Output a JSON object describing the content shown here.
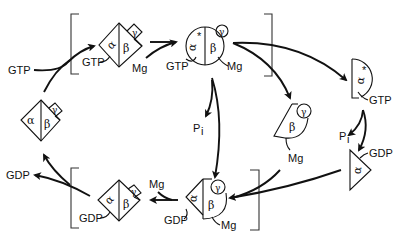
{
  "diagram": {
    "type": "G-protein activation cycle",
    "labels": {
      "gtp": "GTP",
      "gdp": "GDP",
      "mg": "Mg",
      "pi": "P",
      "pi_sub": "i",
      "alpha": "α",
      "alpha_star": "α*",
      "beta": "β",
      "gamma": "γ",
      "star": "*"
    },
    "states": [
      {
        "id": "inactive-heterotrimer",
        "subunits": [
          "α",
          "β",
          "γ"
        ],
        "shape": "diamond"
      },
      {
        "id": "gtp-bound-heterotrimer",
        "subunits": [
          "α",
          "β",
          "γ"
        ],
        "ligands": [
          "GTP",
          "Mg"
        ],
        "shape": "diamond",
        "bracketed": true
      },
      {
        "id": "activated-heterotrimer",
        "subunits": [
          "α*",
          "β",
          "γ"
        ],
        "ligands": [
          "GTP",
          "Mg"
        ],
        "shape": "circle",
        "bracketed": true
      },
      {
        "id": "alpha-star-gtp",
        "subunits": [
          "α*"
        ],
        "ligands": [
          "GTP"
        ],
        "shape": "half-circle"
      },
      {
        "id": "beta-gamma-mg",
        "subunits": [
          "β",
          "γ"
        ],
        "ligands": [
          "Mg"
        ]
      },
      {
        "id": "alpha-gdp",
        "subunits": [
          "α"
        ],
        "ligands": [
          "GDP"
        ],
        "shape": "triangle"
      },
      {
        "id": "reassociated-complex",
        "subunits": [
          "α",
          "β",
          "γ"
        ],
        "ligands": [
          "GDP",
          "Mg"
        ],
        "bracketed": true
      },
      {
        "id": "gdp-bound-heterotrimer",
        "subunits": [
          "α",
          "β",
          "γ"
        ],
        "ligands": [
          "GDP"
        ],
        "shape": "diamond",
        "bracketed": true
      }
    ]
  }
}
